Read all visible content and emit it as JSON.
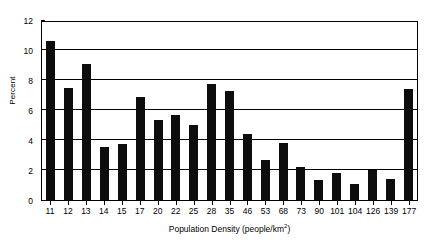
{
  "chart_data": {
    "type": "bar",
    "title": "",
    "xlabel": "Population Density (people/km2)",
    "xlabel_base": "Population Density (people/km",
    "xlabel_sup": "2",
    "xlabel_close": ")",
    "ylabel": "Percent",
    "categories": [
      "11",
      "12",
      "13",
      "14",
      "15",
      "17",
      "20",
      "22",
      "25",
      "28",
      "35",
      "46",
      "53",
      "68",
      "73",
      "90",
      "101",
      "104",
      "126",
      "139",
      "177"
    ],
    "values": [
      10.6,
      7.5,
      9.05,
      3.55,
      3.75,
      6.9,
      5.35,
      5.65,
      5.0,
      7.75,
      7.3,
      4.4,
      2.7,
      3.8,
      2.2,
      1.35,
      1.8,
      1.1,
      2.0,
      1.4,
      7.4
    ],
    "ylim": [
      0,
      12
    ],
    "yticks": [
      0,
      2,
      4,
      6,
      8,
      10,
      12
    ],
    "ytick_labels": [
      "0",
      "2",
      "4",
      "6",
      "8",
      "10",
      "12"
    ],
    "grid": true,
    "grid_axis": "y",
    "legend": false,
    "bar_color": "#0d0d0d",
    "axis_color": "#000000",
    "background": "#ffffff"
  }
}
